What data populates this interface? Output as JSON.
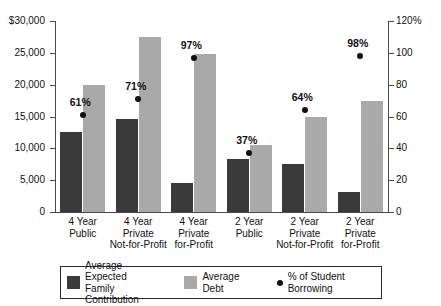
{
  "chart_data": {
    "type": "bar",
    "title": "",
    "subtitle": "",
    "xlabel": "",
    "ylabel": "",
    "y2label": "",
    "grid": false,
    "legend_position": "bottom",
    "categories": [
      "4 Year\nPublic",
      "4 Year\nPrivate\nNot-for-Profit",
      "4 Year\nPrivate\nfor-Profit",
      "2 Year\nPublic",
      "2 Year\nPrivate\nNot-for-Profit",
      "2 Year\nPrivate\nfor-Profit"
    ],
    "series": [
      {
        "name": "Average Expected Family Contribution",
        "axis": "left",
        "type": "bar",
        "color": "#3a3a3a",
        "values": [
          12500,
          14600,
          4600,
          8300,
          7500,
          3200
        ]
      },
      {
        "name": "Average Debt",
        "axis": "left",
        "type": "bar",
        "color": "#a9a9a9",
        "values": [
          20000,
          27500,
          24800,
          10500,
          14900,
          17400
        ]
      },
      {
        "name": "% of Student Borrowing",
        "axis": "right",
        "type": "scatter",
        "color": "#101010",
        "values": [
          61,
          71,
          97,
          37,
          64,
          98
        ],
        "labels": [
          "61%",
          "71%",
          "97%",
          "37%",
          "64%",
          "98%"
        ]
      }
    ],
    "ylim": [
      0,
      30000
    ],
    "y2lim": [
      0,
      120
    ],
    "yticks": [
      0,
      5000,
      10000,
      15000,
      20000,
      25000,
      30000
    ],
    "ytick_labels": [
      "0",
      "5,000",
      "10,000",
      "15,000",
      "20,000",
      "25,000",
      "$30,000"
    ],
    "y2ticks": [
      0,
      20,
      40,
      60,
      80,
      100,
      120
    ],
    "y2tick_labels": [
      "0",
      "20",
      "40",
      "60",
      "80",
      "100",
      "120%"
    ]
  },
  "axes": {
    "left_ticks": [
      {
        "label": "$30,000",
        "value": 30000
      },
      {
        "label": "25,000",
        "value": 25000
      },
      {
        "label": "20,000",
        "value": 20000
      },
      {
        "label": "15,000",
        "value": 15000
      },
      {
        "label": "10,000",
        "value": 10000
      },
      {
        "label": "5,000",
        "value": 5000
      },
      {
        "label": "0",
        "value": 0
      }
    ],
    "right_ticks": [
      {
        "label": "120%",
        "value": 120
      },
      {
        "label": "100",
        "value": 100
      },
      {
        "label": "80",
        "value": 80
      },
      {
        "label": "60",
        "value": 60
      },
      {
        "label": "40",
        "value": 40
      },
      {
        "label": "20",
        "value": 20
      },
      {
        "label": "0",
        "value": 0
      }
    ]
  },
  "categories_display": [
    {
      "line1": "4 Year",
      "line2": "Public",
      "line3": ""
    },
    {
      "line1": "4 Year",
      "line2": "Private",
      "line3": "Not-for-Profit"
    },
    {
      "line1": "4 Year",
      "line2": "Private",
      "line3": "for-Profit"
    },
    {
      "line1": "2 Year",
      "line2": "Public",
      "line3": ""
    },
    {
      "line1": "2 Year",
      "line2": "Private",
      "line3": "Not-for-Profit"
    },
    {
      "line1": "2 Year",
      "line2": "Private",
      "line3": "for-Profit"
    }
  ],
  "point_labels": [
    "61%",
    "71%",
    "97%",
    "37%",
    "64%",
    "98%"
  ],
  "legend": {
    "items": [
      {
        "label": "Average Expected\nFamily Contribution",
        "color": "#3a3a3a",
        "marker": "square"
      },
      {
        "label": "Average Debt",
        "color": "#a9a9a9",
        "marker": "square"
      },
      {
        "label": "% of Student Borrowing",
        "color": "#101010",
        "marker": "dot"
      }
    ]
  }
}
